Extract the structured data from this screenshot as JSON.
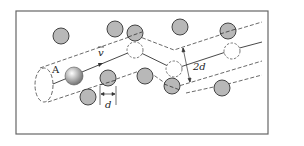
{
  "diagram": {
    "labels": {
      "particle": "A",
      "velocity": "v",
      "diameter": "d",
      "cylinder_diameter": "2d"
    },
    "colors": {
      "frame": "#555555",
      "molecule_fill": "#b8b8b8",
      "molecule_stroke": "#444444",
      "line": "#333333",
      "background": "#ffffff"
    },
    "molecules_filled": [
      {
        "x": 61,
        "y": 36
      },
      {
        "x": 115,
        "y": 29
      },
      {
        "x": 135,
        "y": 33
      },
      {
        "x": 180,
        "y": 27
      },
      {
        "x": 228,
        "y": 31
      },
      {
        "x": 108,
        "y": 78
      },
      {
        "x": 145,
        "y": 76
      },
      {
        "x": 172,
        "y": 86
      },
      {
        "x": 222,
        "y": 88
      },
      {
        "x": 88,
        "y": 97
      }
    ],
    "molecules_dashed": [
      {
        "x": 135,
        "y": 50
      },
      {
        "x": 174,
        "y": 69
      },
      {
        "x": 232,
        "y": 51
      }
    ],
    "particle_A": {
      "x": 74,
      "y": 76
    }
  }
}
